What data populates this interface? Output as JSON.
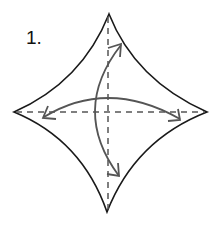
{
  "step": {
    "label": "1."
  },
  "colors": {
    "outline": "#1a1a1a",
    "fold_line": "#555555",
    "arrow": "#555555",
    "background": "#ffffff"
  },
  "diagram": {
    "shape": "concave-diamond",
    "vertices": {
      "top": [
        109,
        14
      ],
      "right": [
        207,
        112
      ],
      "bottom": [
        107,
        212
      ],
      "left": [
        14,
        112
      ]
    },
    "fold_lines": [
      {
        "type": "valley-dashed",
        "orientation": "horizontal"
      },
      {
        "type": "valley-dashed",
        "orientation": "vertical"
      }
    ],
    "arrows": [
      {
        "type": "fold-unfold",
        "direction": "left-right"
      },
      {
        "type": "fold-unfold",
        "direction": "top-bottom"
      }
    ]
  }
}
